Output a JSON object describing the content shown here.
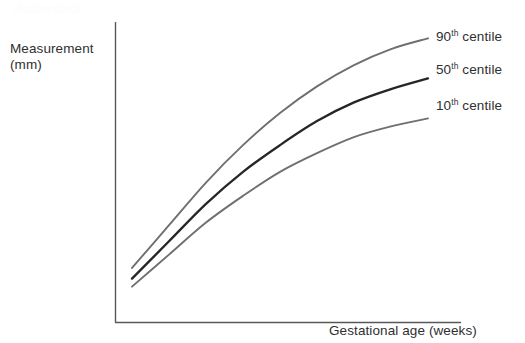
{
  "figure": {
    "background_color": "#ffffff",
    "watermark_text": "shutterstock",
    "watermark_color": "#fcfcfc"
  },
  "axes": {
    "y_title_line1": "Measurement",
    "y_title_line2": "(mm)",
    "x_title": "Gestational age (weeks)",
    "axis_color": "#595959"
  },
  "legend": {
    "items": [
      {
        "label_number": "90",
        "label_suffix": "th",
        "label_rest": " centile",
        "color": "#6f6f6f"
      },
      {
        "label_number": "50",
        "label_suffix": "th",
        "label_rest": " centile",
        "color": "#262626"
      },
      {
        "label_number": "10",
        "label_suffix": "th",
        "label_rest": " centile",
        "color": "#6f6f6f"
      }
    ]
  },
  "chart_data": {
    "type": "line",
    "title": "",
    "xlabel": "Gestational age (weeks)",
    "ylabel": "Measurement (mm)",
    "grid": false,
    "legend_position": "right-inline-at-line-ends",
    "axis_ticks": [],
    "xlim": [
      0,
      100
    ],
    "ylim": [
      0,
      100
    ],
    "x": [
      0,
      12.5,
      25,
      37.5,
      50,
      62.5,
      75,
      87.5,
      100
    ],
    "series": [
      {
        "name": "90th centile",
        "color": "#6f6f6f",
        "line_width": 1.9,
        "values": [
          12,
          28,
          44,
          58,
          70,
          80,
          88,
          94,
          98
        ]
      },
      {
        "name": "50th centile",
        "color": "#262626",
        "line_width": 2.3,
        "values": [
          8,
          22,
          36,
          48,
          58,
          67,
          74,
          79,
          83
        ]
      },
      {
        "name": "10th centile",
        "color": "#6f6f6f",
        "line_width": 1.9,
        "values": [
          5,
          17,
          29,
          39,
          48,
          55,
          61,
          65,
          68
        ]
      }
    ]
  }
}
